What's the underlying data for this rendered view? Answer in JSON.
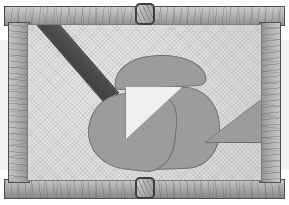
{
  "scene": {
    "title": "Wooden framed board with cut-out shapes",
    "width": 289,
    "height": 205,
    "background_color": "#ffffff"
  },
  "frame": {
    "material": "wood",
    "rails": [
      {
        "name": "top-rail",
        "grain": "horizontal",
        "color": "#b6b6b6"
      },
      {
        "name": "bottom-rail",
        "grain": "horizontal",
        "color": "#b0b0b0"
      },
      {
        "name": "left-rail",
        "grain": "vertical",
        "color": "#b2b2b2"
      },
      {
        "name": "right-rail",
        "grain": "vertical",
        "color": "#b6b6b6"
      }
    ],
    "border_color": "#4e4e4e",
    "clasps": [
      {
        "name": "top-clasp",
        "position": "top-center",
        "color": "#b4b4b4"
      },
      {
        "name": "bottom-clasp",
        "position": "bottom-center",
        "color": "#b4b4b4"
      }
    ]
  },
  "backing": {
    "name": "textured-board",
    "color": "#dedede",
    "texture": "speckled-canvas",
    "border_color": "#7d7d7d"
  },
  "shapes": [
    {
      "name": "dark-bar",
      "kind": "rectangle",
      "description": "long dark diagonal bar",
      "color": "#4a4a4a",
      "outline": "#333333",
      "rotation_deg": 49
    },
    {
      "name": "upper-blob",
      "kind": "blob",
      "description": "curved dome-shaped gray piece with pointed left tip",
      "color": "#9c9c9c",
      "outline": "#6f6f6f",
      "rotation_deg": -3
    },
    {
      "name": "lower-left-blob",
      "kind": "blob",
      "description": "irregular organic gray piece",
      "color": "#9c9c9c",
      "outline": "#6f6f6f",
      "rotation_deg": 6
    },
    {
      "name": "right-lobe-blob",
      "kind": "blob",
      "description": "rounded gray lobe beneath the light wedge",
      "color": "#9c9c9c",
      "outline": "#6f6f6f",
      "rotation_deg": -2
    },
    {
      "name": "light-wedge",
      "kind": "triangle",
      "description": "white triangular wedge cut from the center piece",
      "color": "#f0f0f0",
      "outline": "#8a8a8a",
      "rotation_deg": 0
    },
    {
      "name": "right-triangle",
      "kind": "triangle",
      "description": "small gray right triangle on the right side",
      "color": "#9c9c9c",
      "outline": "#6f6f6f",
      "rotation_deg": 0
    }
  ],
  "palette": {
    "frame_light": "#cfcfcf",
    "frame_mid": "#b2b2b2",
    "frame_dark": "#8c8c8c",
    "outline": "#4e4e4e",
    "board": "#dedede",
    "shape_gray": "#9c9c9c",
    "shape_dark": "#4a4a4a",
    "shape_light": "#f0f0f0"
  }
}
